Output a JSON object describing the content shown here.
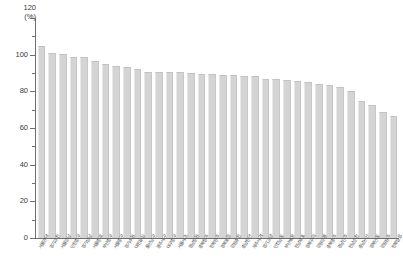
{
  "chart_data": {
    "type": "bar",
    "title": "",
    "subtitle": "",
    "xlabel": "",
    "ylabel": "(%)",
    "unit_label": "(%)",
    "ylim": [
      0,
      120
    ],
    "ytick_step": 20,
    "yticks": [
      0,
      20,
      40,
      60,
      80,
      100,
      120
    ],
    "ytick_labels": [
      "0",
      "20",
      "40",
      "60",
      "80",
      "100",
      "120"
    ],
    "grid": false,
    "legend": "none",
    "bar_color": "#d4d4d4",
    "axis_color": "#6e6e6e",
    "text_color": "#3a3a3a",
    "categories": [
      "서울관악",
      "경기과천",
      "서울강남",
      "인천중구",
      "경기성남",
      "서울종로",
      "부산중구",
      "서울중구",
      "경기수원",
      "대전유성",
      "울산남구",
      "광주서구",
      "대구중구",
      "서울서초",
      "경남창원",
      "충북청주",
      "전북전주",
      "경북포항",
      "강원춘천",
      "충남천안",
      "제주서귀",
      "경기고양",
      "인천남동",
      "부산해운",
      "전남목포",
      "경북구미",
      "강원강릉",
      "충북충주",
      "경남진주",
      "전남순천",
      "충남논산",
      "경북안동",
      "강원원주",
      "전북정읍"
    ],
    "values": [
      105,
      101,
      100.5,
      99,
      99,
      96.5,
      95,
      94,
      93.5,
      92,
      90.5,
      90.5,
      90.5,
      90.5,
      90,
      89.5,
      89.5,
      89,
      89,
      88.5,
      88.5,
      87,
      86.5,
      86,
      85.5,
      85,
      84,
      83.5,
      82.5,
      80,
      74.5,
      72.5,
      69,
      66.5
    ]
  }
}
